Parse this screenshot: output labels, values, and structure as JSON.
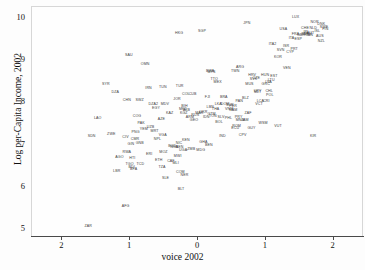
{
  "chart_data": {
    "type": "scatter",
    "title": "",
    "xlabel": "voice 2002",
    "ylabel": "Log per-Capita Income, 2002",
    "xlim": [
      -2.45,
      2.45
    ],
    "ylim": [
      4.82,
      10.25
    ],
    "xticks": [
      -2,
      -1,
      0,
      1,
      2
    ],
    "xticklabels": [
      "2",
      "1",
      "0",
      "1",
      "2"
    ],
    "yticks": [
      5,
      6,
      7,
      8,
      9,
      10
    ],
    "yticklabels": [
      "5",
      "6",
      "7",
      "8",
      "9",
      "10"
    ],
    "grid": false,
    "legend": null,
    "marker_style": "text-label",
    "points": [
      {
        "label": "SYR",
        "x": -1.36,
        "y": 8.4
      },
      {
        "label": "DZA",
        "x": -1.22,
        "y": 8.23
      },
      {
        "label": "CHN",
        "x": -1.05,
        "y": 8.04
      },
      {
        "label": "SWZ",
        "x": -0.86,
        "y": 8.02
      },
      {
        "label": "IRN",
        "x": -0.73,
        "y": 8.32
      },
      {
        "label": "TUN",
        "x": -0.52,
        "y": 8.33
      },
      {
        "label": "TUR",
        "x": -0.27,
        "y": 8.35
      },
      {
        "label": "COL",
        "x": -0.18,
        "y": 8.18
      },
      {
        "label": "CUB",
        "x": -0.08,
        "y": 8.18
      },
      {
        "label": "DZA2",
        "x": -0.66,
        "y": 7.93
      },
      {
        "label": "MDV",
        "x": -0.49,
        "y": 7.93
      },
      {
        "label": "EGY",
        "x": -0.62,
        "y": 7.84
      },
      {
        "label": "JOR",
        "x": -0.31,
        "y": 8.05
      },
      {
        "label": "BIH",
        "x": -0.2,
        "y": 7.88
      },
      {
        "label": "MKD",
        "x": -0.22,
        "y": 7.83
      },
      {
        "label": "ALB",
        "x": -0.17,
        "y": 7.79
      },
      {
        "label": "KGZ",
        "x": -0.21,
        "y": 7.72
      },
      {
        "label": "LAO",
        "x": -1.48,
        "y": 7.6
      },
      {
        "label": "COG",
        "x": -0.9,
        "y": 7.65
      },
      {
        "label": "SDN",
        "x": -1.57,
        "y": 7.17
      },
      {
        "label": "ZWE",
        "x": -1.28,
        "y": 7.23
      },
      {
        "label": "CIV",
        "x": -1.07,
        "y": 7.16
      },
      {
        "label": "PNG",
        "x": -0.92,
        "y": 7.28
      },
      {
        "label": "CMR",
        "x": -0.93,
        "y": 7.12
      },
      {
        "label": "GIN",
        "x": -0.99,
        "y": 7.0
      },
      {
        "label": "GNB",
        "x": -0.86,
        "y": 7.01
      },
      {
        "label": "RWA",
        "x": -1.05,
        "y": 6.8
      },
      {
        "label": "AGO",
        "x": -1.16,
        "y": 6.68
      },
      {
        "label": "HTI",
        "x": -0.97,
        "y": 6.66
      },
      {
        "label": "TGO",
        "x": -1.01,
        "y": 6.52
      },
      {
        "label": "TCD",
        "x": -0.85,
        "y": 6.52
      },
      {
        "label": "BDI",
        "x": -0.98,
        "y": 6.44
      },
      {
        "label": "BFA",
        "x": -0.95,
        "y": 6.41
      },
      {
        "label": "LBR",
        "x": -1.2,
        "y": 6.36
      },
      {
        "label": "AFG",
        "x": -1.07,
        "y": 5.52
      },
      {
        "label": "ZAR",
        "x": -1.62,
        "y": 5.05
      },
      {
        "label": "NPL",
        "x": -0.6,
        "y": 7.12
      },
      {
        "label": "VGA",
        "x": -0.52,
        "y": 7.2
      },
      {
        "label": "MOZ",
        "x": -0.51,
        "y": 6.8
      },
      {
        "label": "BGD",
        "x": -0.38,
        "y": 6.95
      },
      {
        "label": "NGA",
        "x": -0.35,
        "y": 6.92
      },
      {
        "label": "NIC",
        "x": -0.28,
        "y": 7.02
      },
      {
        "label": "SEN",
        "x": -0.27,
        "y": 6.92
      },
      {
        "label": "CAF",
        "x": -0.4,
        "y": 6.58
      },
      {
        "label": "MLI",
        "x": -0.33,
        "y": 6.55
      },
      {
        "label": "TZA",
        "x": -0.53,
        "y": 6.46
      },
      {
        "label": "COM",
        "x": -0.26,
        "y": 6.33
      },
      {
        "label": "NER",
        "x": -0.2,
        "y": 6.25
      },
      {
        "label": "BLT",
        "x": -0.25,
        "y": 5.93
      },
      {
        "label": "MEX",
        "x": 0.29,
        "y": 8.46
      },
      {
        "label": "FJI",
        "x": 0.14,
        "y": 8.1
      },
      {
        "label": "BRA",
        "x": 0.38,
        "y": 8.09
      },
      {
        "label": "DOM",
        "x": 0.4,
        "y": 7.94
      },
      {
        "label": "SUR",
        "x": 0.47,
        "y": 7.91
      },
      {
        "label": "PER",
        "x": 0.52,
        "y": 7.88
      },
      {
        "label": "VNM",
        "x": 0.46,
        "y": 7.82
      },
      {
        "label": "NAM",
        "x": 0.52,
        "y": 7.8
      },
      {
        "label": "THA",
        "x": 0.26,
        "y": 7.82
      },
      {
        "label": "LBN",
        "x": 0.18,
        "y": 7.86
      },
      {
        "label": "TON",
        "x": 0.22,
        "y": 7.66
      },
      {
        "label": "SLV",
        "x": 0.34,
        "y": 7.62
      },
      {
        "label": "PHL",
        "x": 0.45,
        "y": 7.6
      },
      {
        "label": "PRY",
        "x": 0.6,
        "y": 7.64
      },
      {
        "label": "BOL",
        "x": 0.31,
        "y": 7.52
      },
      {
        "label": "MNG",
        "x": 0.62,
        "y": 7.57
      },
      {
        "label": "ECU",
        "x": 0.55,
        "y": 7.36
      },
      {
        "label": "ROM",
        "x": 0.57,
        "y": 7.42
      },
      {
        "label": "GUY",
        "x": 0.79,
        "y": 7.38
      },
      {
        "label": "CPV",
        "x": 0.66,
        "y": 7.2
      },
      {
        "label": "JAM",
        "x": 0.69,
        "y": 7.56
      },
      {
        "label": "ZAF",
        "x": 0.74,
        "y": 7.72
      },
      {
        "label": "PAN",
        "x": 0.61,
        "y": 8.01
      },
      {
        "label": "BLZ",
        "x": 0.7,
        "y": 8.08
      },
      {
        "label": "LCA",
        "x": 0.92,
        "y": 8.0
      },
      {
        "label": "CRI",
        "x": 1.01,
        "y": 8.0
      },
      {
        "label": "VCT",
        "x": 0.9,
        "y": 7.93
      },
      {
        "label": "MUS",
        "x": 0.76,
        "y": 8.4
      },
      {
        "label": "GRC",
        "x": 1.0,
        "y": 8.4
      },
      {
        "label": "URY",
        "x": 0.88,
        "y": 8.25
      },
      {
        "label": "MLT",
        "x": 0.88,
        "y": 8.22
      },
      {
        "label": "CHL",
        "x": 1.05,
        "y": 8.25
      },
      {
        "label": "POL",
        "x": 1.06,
        "y": 8.14
      },
      {
        "label": "TTO",
        "x": 0.24,
        "y": 8.52
      },
      {
        "label": "BWA",
        "x": 0.18,
        "y": 8.72
      },
      {
        "label": "MYS",
        "x": 0.2,
        "y": 8.7
      },
      {
        "label": "TWN",
        "x": 0.55,
        "y": 8.72
      },
      {
        "label": "CZE",
        "x": 0.86,
        "y": 8.56
      },
      {
        "label": "SVK",
        "x": 0.82,
        "y": 8.52
      },
      {
        "label": "HUN",
        "x": 0.99,
        "y": 8.62
      },
      {
        "label": "VEN",
        "x": 1.31,
        "y": 8.78
      },
      {
        "label": "KOR",
        "x": 1.18,
        "y": 9.05
      },
      {
        "label": "SGP",
        "x": 0.06,
        "y": 9.65
      },
      {
        "label": "HKG",
        "x": -0.28,
        "y": 9.62
      },
      {
        "label": "JPN",
        "x": 0.72,
        "y": 9.85
      },
      {
        "label": "LUX",
        "x": 1.44,
        "y": 9.98
      },
      {
        "label": "USA",
        "x": 1.26,
        "y": 9.7
      },
      {
        "label": "CHE",
        "x": 1.58,
        "y": 9.72
      },
      {
        "label": "NOR",
        "x": 1.72,
        "y": 9.88
      },
      {
        "label": "DNK",
        "x": 1.82,
        "y": 9.82
      },
      {
        "label": "SWE",
        "x": 1.86,
        "y": 9.76
      },
      {
        "label": "NLD",
        "x": 1.7,
        "y": 9.72
      },
      {
        "label": "FIN",
        "x": 1.88,
        "y": 9.7
      },
      {
        "label": "ISL",
        "x": 1.76,
        "y": 9.66
      },
      {
        "label": "IRL",
        "x": 1.6,
        "y": 9.64
      },
      {
        "label": "AUT",
        "x": 1.66,
        "y": 9.62
      },
      {
        "label": "BEL",
        "x": 1.58,
        "y": 9.6
      },
      {
        "label": "DEU",
        "x": 1.62,
        "y": 9.58
      },
      {
        "label": "FRA",
        "x": 1.44,
        "y": 9.58
      },
      {
        "label": "GBR",
        "x": 1.52,
        "y": 9.56
      },
      {
        "label": "CAN",
        "x": 1.64,
        "y": 9.56
      },
      {
        "label": "AUS",
        "x": 1.8,
        "y": 9.54
      },
      {
        "label": "ITA",
        "x": 1.38,
        "y": 9.5
      },
      {
        "label": "ESP",
        "x": 1.48,
        "y": 9.46
      },
      {
        "label": "NZL",
        "x": 1.82,
        "y": 9.42
      },
      {
        "label": "PRT",
        "x": 1.42,
        "y": 9.24
      },
      {
        "label": "ISR",
        "x": 1.3,
        "y": 9.3
      },
      {
        "label": "ITA2",
        "x": 1.1,
        "y": 9.36
      },
      {
        "label": "SVN",
        "x": 1.22,
        "y": 9.22
      },
      {
        "label": "CYP",
        "x": 1.36,
        "y": 9.16
      },
      {
        "label": "KIR",
        "x": 1.7,
        "y": 7.18
      },
      {
        "label": "VUT",
        "x": 1.18,
        "y": 7.42
      },
      {
        "label": "EST",
        "x": 1.12,
        "y": 8.6
      },
      {
        "label": "LTU",
        "x": 1.08,
        "y": 8.5
      },
      {
        "label": "LVA",
        "x": 1.04,
        "y": 8.46
      },
      {
        "label": "HRV",
        "x": 0.8,
        "y": 8.62
      },
      {
        "label": "ARG",
        "x": 0.62,
        "y": 8.82
      },
      {
        "label": "WSM",
        "x": 0.96,
        "y": 7.48
      },
      {
        "label": "IND",
        "x": 0.36,
        "y": 7.18
      },
      {
        "label": "LKA",
        "x": 0.3,
        "y": 7.94
      },
      {
        "label": "IDN",
        "x": 0.12,
        "y": 7.62
      },
      {
        "label": "GTM",
        "x": 0.2,
        "y": 7.7
      },
      {
        "label": "MAR",
        "x": 0.02,
        "y": 7.72
      },
      {
        "label": "UKR",
        "x": 0.08,
        "y": 7.74
      },
      {
        "label": "RUS",
        "x": -0.04,
        "y": 7.68
      },
      {
        "label": "KAZ",
        "x": -0.42,
        "y": 7.72
      },
      {
        "label": "AZE",
        "x": -0.54,
        "y": 7.58
      },
      {
        "label": "UZB",
        "x": -0.7,
        "y": 7.4
      },
      {
        "label": "ARM",
        "x": -0.12,
        "y": 7.62
      },
      {
        "label": "GEO",
        "x": -0.06,
        "y": 7.56
      },
      {
        "label": "KEN",
        "x": -0.18,
        "y": 7.08
      },
      {
        "label": "GHA",
        "x": 0.08,
        "y": 7.04
      },
      {
        "label": "ZMB",
        "x": -0.1,
        "y": 6.88
      },
      {
        "label": "UGA",
        "x": -0.22,
        "y": 6.84
      },
      {
        "label": "ETH",
        "x": -0.58,
        "y": 6.62
      },
      {
        "label": "MWI",
        "x": -0.3,
        "y": 6.7
      },
      {
        "label": "BEN",
        "x": 0.16,
        "y": 6.98
      },
      {
        "label": "MDG",
        "x": 0.04,
        "y": 6.86
      },
      {
        "label": "ERI",
        "x": -0.72,
        "y": 6.76
      },
      {
        "label": "YEM",
        "x": -0.8,
        "y": 7.34
      },
      {
        "label": "PAK",
        "x": -0.84,
        "y": 7.48
      },
      {
        "label": "SLE",
        "x": -0.48,
        "y": 6.18
      },
      {
        "label": "MRT",
        "x": -0.64,
        "y": 7.3
      },
      {
        "label": "SAU",
        "x": -1.02,
        "y": 9.1
      },
      {
        "label": "OMN",
        "x": -0.78,
        "y": 8.88
      }
    ]
  }
}
